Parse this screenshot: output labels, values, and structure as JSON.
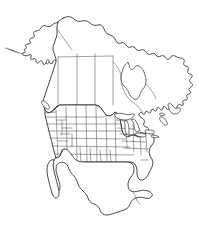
{
  "document": {
    "type": "outline-map",
    "title": "North America Outline Map",
    "caption": "",
    "width_px": 199,
    "height_px": 235,
    "background_color": "#ffffff",
    "has_labels": false,
    "has_legend": false,
    "has_scale_bar": false,
    "has_compass": false,
    "has_graticule": false,
    "has_frame": false
  },
  "style": {
    "coastline_color": "#2b2b2b",
    "coastline_width": 0.85,
    "internal_border_color": "#555555",
    "internal_border_width": 0.55,
    "land_fill": "#ffffff",
    "water_fill": "#ffffff"
  },
  "map": {
    "region": "North America",
    "projection_note": "conic",
    "features": [
      {
        "name": "canada-mainland",
        "kind": "country",
        "label": "Canada",
        "subdivisions_shown": true
      },
      {
        "name": "united-states-contiguous",
        "kind": "country",
        "label": "United States",
        "subdivisions_shown": true
      },
      {
        "name": "alaska",
        "kind": "state",
        "label": "Alaska",
        "subdivisions_shown": false
      },
      {
        "name": "mexico",
        "kind": "country",
        "label": "Mexico",
        "subdivisions_shown": false
      },
      {
        "name": "baja-california-peninsula",
        "kind": "peninsula",
        "label": "Baja California",
        "subdivisions_shown": false
      },
      {
        "name": "yucatan-peninsula",
        "kind": "peninsula",
        "label": "Yucatan",
        "subdivisions_shown": false
      },
      {
        "name": "florida-peninsula",
        "kind": "peninsula",
        "label": "Florida",
        "subdivisions_shown": false
      },
      {
        "name": "hudson-bay",
        "kind": "bay",
        "label": "Hudson Bay",
        "subdivisions_shown": false
      },
      {
        "name": "great-lakes",
        "kind": "lakes",
        "label": "Great Lakes",
        "subdivisions_shown": false
      },
      {
        "name": "newfoundland",
        "kind": "island",
        "label": "Newfoundland",
        "subdivisions_shown": false
      },
      {
        "name": "aleutian-islands",
        "kind": "island-chain",
        "label": "Aleutian Islands",
        "subdivisions_shown": false
      },
      {
        "name": "labrador-peninsula",
        "kind": "peninsula",
        "label": "Labrador",
        "subdivisions_shown": false
      }
    ]
  }
}
